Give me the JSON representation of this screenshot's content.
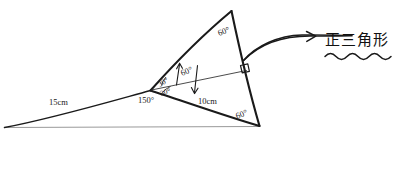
{
  "figure": {
    "ink_color": "#1a1a1a",
    "faint_color": "#8a8a8a",
    "background": "#ffffff",
    "labels": {
      "length_left": "15cm",
      "length_base": "10cm",
      "angle_obtuse": "150°",
      "angle_upper_split": "30°",
      "angle_lower_split": "30°",
      "angle_cevian": "60°",
      "angle_apex": "60°",
      "angle_bottom_right": "60°"
    },
    "annotation": {
      "text": "正三角形",
      "arrow": "curved-arrow-right",
      "underline": "wavy-underline"
    },
    "markers": {
      "right_angle": "right-angle-square"
    }
  }
}
